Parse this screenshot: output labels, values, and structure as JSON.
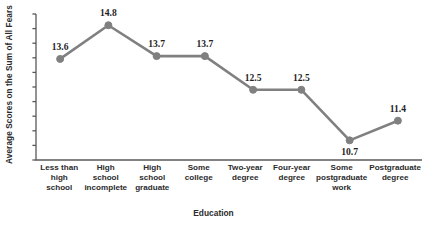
{
  "chart_data": {
    "type": "line",
    "title": "",
    "xlabel": "Education",
    "ylabel": "Average Scores on the Sum of All Fears",
    "categories": [
      "Less than high school",
      "High school incomplete",
      "High school graduate",
      "Some college",
      "Two-year degree",
      "Four-year degree",
      "Some postgraduate work",
      "Postgraduate degree"
    ],
    "category_lines": [
      [
        "Less than",
        "high school"
      ],
      [
        "High",
        "school",
        "incomplete"
      ],
      [
        "High",
        "school",
        "graduate"
      ],
      [
        "Some",
        "college"
      ],
      [
        "Two-year",
        "degree"
      ],
      [
        "Four-year",
        "degree"
      ],
      [
        "Some",
        "postgraduate",
        "work"
      ],
      [
        "Postgraduate",
        "degree"
      ]
    ],
    "values": [
      13.6,
      14.8,
      13.7,
      13.7,
      12.5,
      12.5,
      10.7,
      11.4
    ],
    "point_labels": [
      "13.6",
      "14.8",
      "13.7",
      "13.7",
      "12.5",
      "12.5",
      "10.7",
      "11.4"
    ],
    "label_positions": [
      "above",
      "above",
      "above",
      "above",
      "above",
      "above",
      "below",
      "above"
    ],
    "ylim": [
      10.0,
      15.2
    ],
    "y_tick_count": 10,
    "y_tick_labels_shown": false,
    "grid": false,
    "legend": false,
    "series_color": "#808080",
    "axis_color": "#595959",
    "marker": "circle"
  }
}
